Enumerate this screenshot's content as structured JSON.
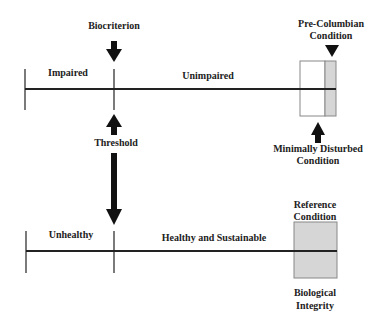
{
  "diagram": {
    "top_scale": {
      "left_label": "Impaired",
      "right_label": "Unimpaired",
      "marker_top_label": "Biocriterion",
      "end_top_label_line1": "Pre-Columbian",
      "end_top_label_line2": "Condition",
      "end_bottom_label_line1": "Minimally Disturbed",
      "end_bottom_label_line2": "Condition"
    },
    "middle": {
      "threshold_label": "Threshold"
    },
    "bottom_scale": {
      "left_label": "Unhealthy",
      "right_label": "Healthy and Sustainable",
      "end_top_label_line1": "Reference",
      "end_top_label_line2": "Condition",
      "end_bottom_label_line1": "Biological",
      "end_bottom_label_line2": "Integrity"
    },
    "colors": {
      "line": "#222222",
      "shade": "#d6d6d6",
      "box_border": "#888888"
    }
  }
}
